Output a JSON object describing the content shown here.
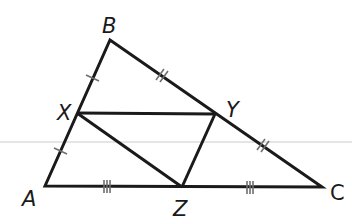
{
  "diagram": {
    "type": "geometry-triangle-midsegments",
    "colors": {
      "stroke": "#1a1a1a",
      "tick": "#777777",
      "guide": "#d8d8d8"
    },
    "points": {
      "A": {
        "label": "A",
        "x": 45,
        "y": 186
      },
      "B": {
        "label": "B",
        "x": 110,
        "y": 40
      },
      "C": {
        "label": "C",
        "x": 322,
        "y": 187
      },
      "X": {
        "label": "X",
        "x": 77,
        "y": 113
      },
      "Y": {
        "label": "Y",
        "x": 215,
        "y": 114
      },
      "Z": {
        "label": "Z",
        "x": 182,
        "y": 187
      }
    },
    "segments": [
      "AB",
      "BC",
      "CA",
      "XY",
      "YZ",
      "ZX"
    ],
    "tick_marks": [
      {
        "segment": "BX",
        "count": 1
      },
      {
        "segment": "XA",
        "count": 1
      },
      {
        "segment": "BY",
        "count": 2
      },
      {
        "segment": "YC",
        "count": 2
      },
      {
        "segment": "AZ",
        "count": 3
      },
      {
        "segment": "ZC",
        "count": 3
      }
    ]
  }
}
